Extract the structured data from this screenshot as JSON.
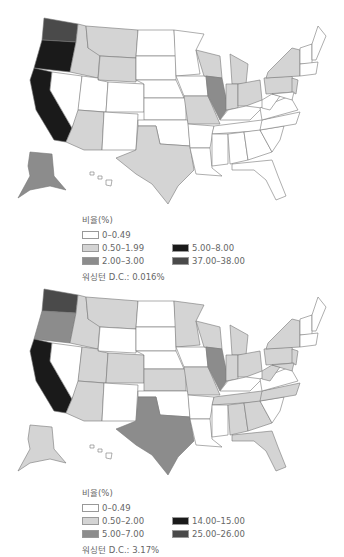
{
  "maps": [
    {
      "legend": {
        "title": "비율(%)",
        "items": [
          {
            "label": "0–0.49",
            "color": "#ffffff"
          },
          {
            "label": "0.50–1.99",
            "color": "#d4d4d4"
          },
          {
            "label": "2.00–3.00",
            "color": "#8c8c8c"
          },
          {
            "label": "5.00–8.00",
            "color": "#1a1a1a"
          },
          {
            "label": "37.00–38.00",
            "color": "#4a4a4a"
          }
        ],
        "note": "워싱턴 D.C.: 0.016%"
      }
    },
    {
      "legend": {
        "title": "비율(%)",
        "items": [
          {
            "label": "0–0.49",
            "color": "#ffffff"
          },
          {
            "label": "0.50–2.00",
            "color": "#d4d4d4"
          },
          {
            "label": "5.00–7.00",
            "color": "#8c8c8c"
          },
          {
            "label": "14.00–15.00",
            "color": "#1a1a1a"
          },
          {
            "label": "25.00–26.00",
            "color": "#4a4a4a"
          }
        ],
        "note": "워싱턴 D.C.: 3.17%"
      }
    }
  ],
  "colors": {
    "white": "#ffffff",
    "light": "#d4d4d4",
    "mid": "#8c8c8c",
    "dark": "#4a4a4a",
    "black": "#1a1a1a"
  }
}
